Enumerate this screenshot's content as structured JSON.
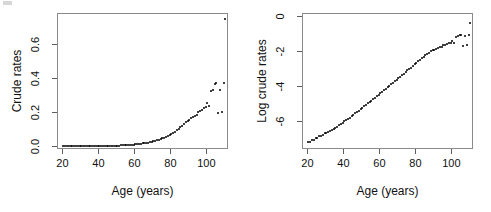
{
  "figure": {
    "width": 491,
    "height": 212,
    "background": "#ffffff",
    "point_color": "#000000",
    "frame_color": "#8a8a8a"
  },
  "chart_data": [
    {
      "type": "scatter",
      "panel": "left",
      "title": "",
      "xlabel": "Age (years)",
      "ylabel": "Crude rates",
      "xlim": [
        17,
        112
      ],
      "ylim": [
        -0.02,
        0.78
      ],
      "xticks": [
        20,
        40,
        60,
        80,
        100
      ],
      "xticklabels": [
        "20",
        "40",
        "60",
        "80",
        "100"
      ],
      "yticks": [
        0.0,
        0.2,
        0.4,
        0.6
      ],
      "yticklabels": [
        "0.0",
        "0.2",
        "0.4",
        "0.6"
      ],
      "grid": false,
      "legend": null,
      "x": [
        20,
        21,
        22,
        23,
        24,
        25,
        26,
        27,
        28,
        29,
        30,
        31,
        32,
        33,
        34,
        35,
        36,
        37,
        38,
        39,
        40,
        41,
        42,
        43,
        44,
        45,
        46,
        47,
        48,
        49,
        50,
        51,
        52,
        53,
        54,
        55,
        56,
        57,
        58,
        59,
        60,
        61,
        62,
        63,
        64,
        65,
        66,
        67,
        68,
        69,
        70,
        71,
        72,
        73,
        74,
        75,
        76,
        77,
        78,
        79,
        80,
        81,
        82,
        83,
        84,
        85,
        86,
        87,
        88,
        89,
        90,
        91,
        92,
        93,
        94,
        95,
        96,
        97,
        98,
        99,
        100,
        101,
        102,
        103,
        104,
        105,
        106,
        107,
        108,
        109,
        110
      ],
      "y": [
        0.0008,
        0.0008,
        0.0009,
        0.0009,
        0.001,
        0.001,
        0.0011,
        0.0011,
        0.0012,
        0.0013,
        0.0013,
        0.0014,
        0.0015,
        0.0016,
        0.0017,
        0.0018,
        0.0019,
        0.0021,
        0.0022,
        0.0024,
        0.0026,
        0.0028,
        0.003,
        0.0032,
        0.0035,
        0.0038,
        0.0041,
        0.0044,
        0.0048,
        0.0052,
        0.0056,
        0.0061,
        0.0066,
        0.0072,
        0.0078,
        0.0085,
        0.0092,
        0.01,
        0.0109,
        0.0119,
        0.013,
        0.0141,
        0.0154,
        0.0168,
        0.0183,
        0.02,
        0.0218,
        0.0238,
        0.026,
        0.0283,
        0.0309,
        0.0337,
        0.0368,
        0.0401,
        0.0438,
        0.0478,
        0.0521,
        0.0568,
        0.062,
        0.0676,
        0.0737,
        0.0803,
        0.0875,
        0.0953,
        0.1038,
        0.113,
        0.123,
        0.1338,
        0.1455,
        0.1505,
        0.158,
        0.166,
        0.173,
        0.18,
        0.187,
        0.202,
        0.212,
        0.218,
        0.225,
        0.232,
        0.256,
        0.238,
        0.33,
        0.335,
        0.37,
        0.376,
        0.199,
        0.335,
        0.203,
        0.372,
        0.75,
        0.605,
        0.605
      ]
    },
    {
      "type": "scatter",
      "panel": "right",
      "title": "",
      "xlabel": "Age (years)",
      "ylabel": "Log crude rates",
      "xlim": [
        17,
        112
      ],
      "ylim": [
        -7.6,
        0.2
      ],
      "xticks": [
        20,
        40,
        60,
        80,
        100
      ],
      "xticklabels": [
        "20",
        "40",
        "60",
        "80",
        "100"
      ],
      "yticks": [
        0,
        -2,
        -4,
        -6
      ],
      "yticklabels": [
        "0",
        "-2",
        "-4",
        "-6"
      ],
      "grid": false,
      "legend": null,
      "x": [
        20,
        21,
        22,
        23,
        24,
        25,
        26,
        27,
        28,
        29,
        30,
        31,
        32,
        33,
        34,
        35,
        36,
        37,
        38,
        39,
        40,
        41,
        42,
        43,
        44,
        45,
        46,
        47,
        48,
        49,
        50,
        51,
        52,
        53,
        54,
        55,
        56,
        57,
        58,
        59,
        60,
        61,
        62,
        63,
        64,
        65,
        66,
        67,
        68,
        69,
        70,
        71,
        72,
        73,
        74,
        75,
        76,
        77,
        78,
        79,
        80,
        81,
        82,
        83,
        84,
        85,
        86,
        87,
        88,
        89,
        90,
        91,
        92,
        93,
        94,
        95,
        96,
        97,
        98,
        99,
        100,
        101,
        102,
        103,
        104,
        105,
        106,
        107,
        108,
        109,
        110
      ],
      "y": [
        -7.13,
        -7.13,
        -7.01,
        -7.01,
        -6.91,
        -6.91,
        -6.81,
        -6.81,
        -6.72,
        -6.65,
        -6.65,
        -6.57,
        -6.5,
        -6.44,
        -6.38,
        -6.32,
        -6.27,
        -6.17,
        -6.12,
        -6.03,
        -5.95,
        -5.88,
        -5.81,
        -5.74,
        -5.66,
        -5.57,
        -5.5,
        -5.43,
        -5.34,
        -5.26,
        -5.18,
        -5.1,
        -5.02,
        -4.93,
        -4.85,
        -4.77,
        -4.69,
        -4.61,
        -4.52,
        -4.43,
        -4.34,
        -4.26,
        -4.17,
        -4.09,
        -4.0,
        -3.91,
        -3.83,
        -3.74,
        -3.65,
        -3.56,
        -3.48,
        -3.39,
        -3.3,
        -3.22,
        -3.13,
        -3.04,
        -2.95,
        -2.87,
        -2.78,
        -2.69,
        -2.61,
        -2.52,
        -2.44,
        -2.35,
        -2.27,
        -2.18,
        -2.1,
        -2.01,
        -1.93,
        -1.89,
        -1.84,
        -1.8,
        -1.75,
        -1.71,
        -1.68,
        -1.6,
        -1.55,
        -1.52,
        -1.49,
        -1.46,
        -1.36,
        -1.44,
        -1.11,
        -1.09,
        -0.99,
        -0.98,
        -1.61,
        -1.09,
        -1.59,
        -0.99,
        -0.29,
        -0.5,
        -0.5
      ]
    }
  ]
}
